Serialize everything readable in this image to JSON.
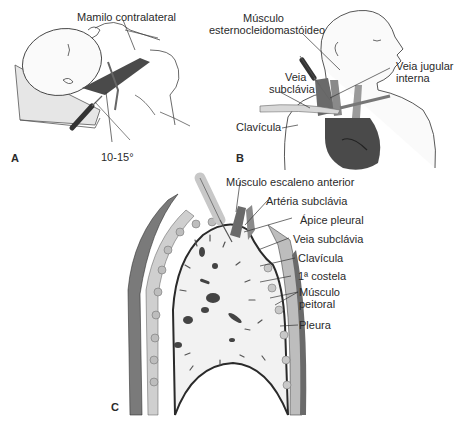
{
  "figure": {
    "panels": [
      {
        "id": "A",
        "letter": "A",
        "labels": {
          "nipple": "Mamilo contralateral",
          "angle": "10-15°"
        }
      },
      {
        "id": "B",
        "letter": "B",
        "labels": {
          "scm_line1": "Músculo",
          "scm_line2": "esternocleidomastóideo",
          "ijv_line1": "Veia jugular",
          "ijv_line2": "interna",
          "sv_line1": "Veia",
          "sv_line2": "subclávia",
          "clavicle": "Clavícula"
        }
      },
      {
        "id": "C",
        "letter": "C",
        "labels": {
          "scalene": "Músculo escaleno anterior",
          "subclavian_artery": "Artéria subclávia",
          "pleural_apex": "Ápice pleural",
          "subclavian_vein": "Veia subclávia",
          "clavicle": "Clavícula",
          "first_rib": "1ª costela",
          "pectoral_line1": "Músculo",
          "pectoral_line2": "peitoral",
          "pleura": "Pleura"
        }
      }
    ],
    "colors": {
      "ink": "#2a2a2a",
      "dark_tissue": "#4a4a4a",
      "mid_tissue": "#8a8a8a",
      "light_tissue": "#d8d8d8",
      "lung_fill": "#f2f2f2"
    }
  }
}
